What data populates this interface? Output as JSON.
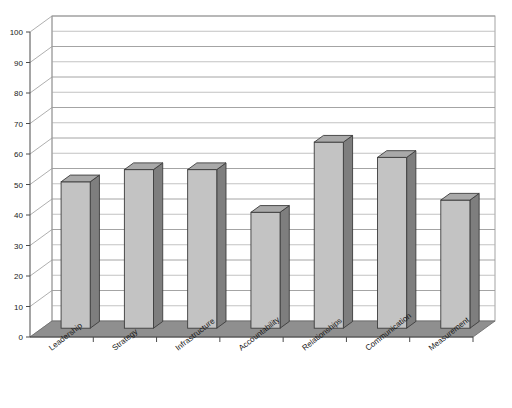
{
  "chart_data": {
    "type": "bar",
    "title": "",
    "subtitle": "",
    "xlabel": "",
    "ylabel": "",
    "categories": [
      "Leadership",
      "Strategy",
      "Infrastructure",
      "Accountability",
      "Relationships",
      "Communication",
      "Measurement"
    ],
    "values": [
      48,
      52,
      52,
      38,
      61,
      56,
      42
    ],
    "ylim": [
      0,
      100
    ],
    "ytick_values": [
      0,
      10,
      20,
      30,
      40,
      50,
      60,
      70,
      80,
      90,
      100
    ],
    "ytick_labels": [
      "0",
      "10",
      "20",
      "30",
      "40",
      "50",
      "60",
      "70",
      "80",
      "90",
      "100"
    ],
    "gridline_values": [
      5,
      15,
      25,
      35,
      45,
      55,
      65,
      75,
      85,
      95,
      100
    ],
    "grid": true,
    "legend": false,
    "legend_position": "none",
    "style": "3d-column",
    "annotations": []
  },
  "colors": {
    "background": "#ffffff",
    "bar_front": "#c3c3c3",
    "bar_side": "#7e7e7e",
    "bar_top": "#a9a9a9",
    "bar_outline": "#3c3c3c",
    "floor": "#8f8f8f",
    "floor_edge": "#6f6f6f",
    "gridline": "#b4b4b4",
    "axis": "#4a4a4a",
    "text": "#1a1a1a"
  },
  "axes": {
    "y_axis_name": "value-axis",
    "x_axis_name": "category-axis"
  }
}
